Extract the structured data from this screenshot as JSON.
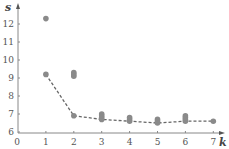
{
  "chart_data": {
    "type": "scatter",
    "title": "",
    "xlabel": "k",
    "ylabel": "s",
    "xlim": [
      0,
      7
    ],
    "ylim": [
      6,
      12.5
    ],
    "x_ticks": [
      "0",
      "1",
      "2",
      "3",
      "4",
      "5",
      "6",
      "7"
    ],
    "y_ticks": [
      "6",
      "7",
      "8",
      "9",
      "10",
      "11",
      "12"
    ],
    "grid": false,
    "legend": null,
    "series": [
      {
        "name": "samples",
        "style": "scatter",
        "color": "#8a8a8a",
        "points": [
          [
            1,
            12.3
          ],
          [
            1,
            9.2
          ],
          [
            2,
            9.3
          ],
          [
            2,
            9.2
          ],
          [
            2,
            9.1
          ],
          [
            2,
            6.9
          ],
          [
            3,
            7.0
          ],
          [
            3,
            6.9
          ],
          [
            3,
            6.8
          ],
          [
            3,
            6.7
          ],
          [
            4,
            6.8
          ],
          [
            4,
            6.7
          ],
          [
            4,
            6.6
          ],
          [
            5,
            6.7
          ],
          [
            5,
            6.6
          ],
          [
            5,
            6.5
          ],
          [
            6,
            6.9
          ],
          [
            6,
            6.8
          ],
          [
            6,
            6.7
          ],
          [
            6,
            6.6
          ],
          [
            7,
            6.6
          ]
        ]
      },
      {
        "name": "minimum",
        "style": "dashed-line",
        "color": "#666666",
        "x": [
          1,
          2,
          3,
          4,
          5,
          6,
          7
        ],
        "values": [
          9.2,
          6.9,
          6.7,
          6.6,
          6.5,
          6.6,
          6.6
        ]
      }
    ]
  },
  "labels": {
    "x_axis": "k",
    "y_axis": "s",
    "x_ticks": [
      "0",
      "1",
      "2",
      "3",
      "4",
      "5",
      "6",
      "7"
    ],
    "y_ticks": [
      "6",
      "7",
      "8",
      "9",
      "10",
      "11",
      "12"
    ]
  }
}
